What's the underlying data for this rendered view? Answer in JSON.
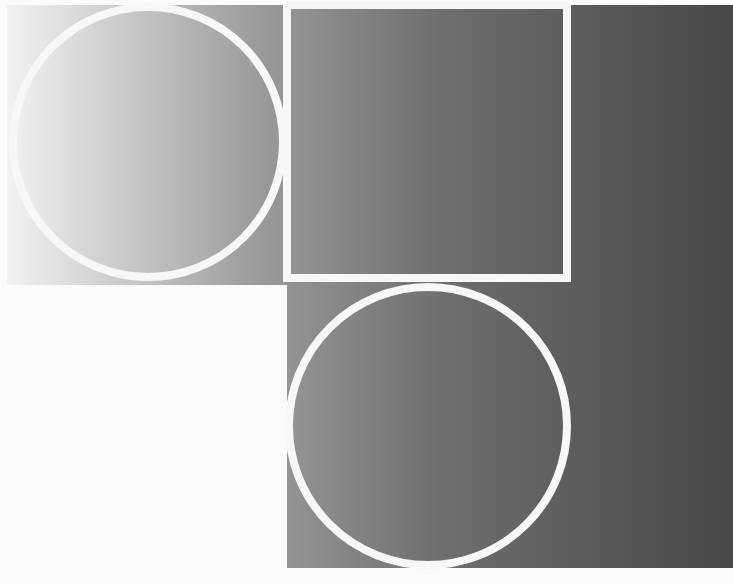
{
  "artwork": {
    "type": "geometric-composition",
    "background_color": "#fbfbfb",
    "gradient": {
      "direction": "horizontal",
      "stops": [
        {
          "offset": "0%",
          "color": "#f2f2f2"
        },
        {
          "offset": "35%",
          "color": "#9a9a9a"
        },
        {
          "offset": "60%",
          "color": "#6e6e6e"
        },
        {
          "offset": "100%",
          "color": "#474747"
        }
      ]
    },
    "stroke_color": "#f7f7f7",
    "shapes": [
      {
        "id": "circle-top-left",
        "shape": "circle",
        "cx": 148,
        "cy": 142,
        "r": 135,
        "stroke_width": 8
      },
      {
        "id": "square-top-center",
        "shape": "rect",
        "x": 287,
        "y": 5,
        "width": 280,
        "height": 273,
        "stroke_width": 8
      },
      {
        "id": "circle-bottom-center",
        "shape": "circle",
        "cx": 428,
        "cy": 426,
        "r": 139,
        "stroke_width": 8
      }
    ]
  }
}
